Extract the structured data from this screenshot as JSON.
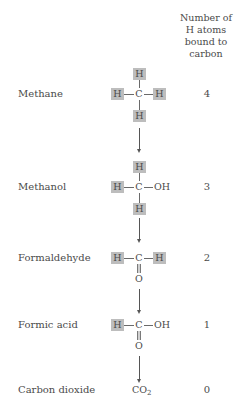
{
  "header": {
    "line1": "Number of",
    "line2": "H atoms",
    "line3": "bound to",
    "line4": "carbon"
  },
  "rows": [
    {
      "name": "Methane",
      "count": "4"
    },
    {
      "name": "Methanol",
      "count": "3"
    },
    {
      "name": "Formaldehyde",
      "count": "2"
    },
    {
      "name": "Formic acid",
      "count": "1"
    },
    {
      "name": "Carbon dioxide",
      "count": "0"
    }
  ],
  "atoms": {
    "H": "H",
    "C": "C",
    "O": "O",
    "OH": "OH",
    "CO2_main": "CO",
    "CO2_sub": "2"
  },
  "colors": {
    "highlight_box": "#bdbdbd",
    "text": "#4a4a4a"
  }
}
